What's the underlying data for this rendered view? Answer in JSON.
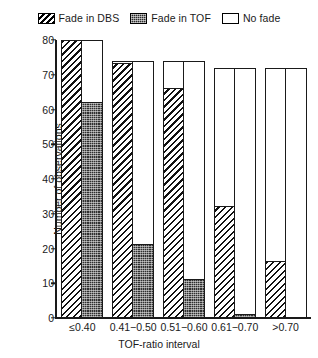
{
  "chart_data": {
    "type": "bar",
    "title": "",
    "subtitle": "",
    "xlabel": "TOF-ratio interval",
    "ylabel": "Number of observations",
    "categories": [
      "≤0.40",
      "0.41−0.50",
      "0.51−0.60",
      "0.61−0.70",
      ">0.70"
    ],
    "ylim": [
      0,
      80
    ],
    "yticks": [
      0,
      10,
      20,
      30,
      40,
      50,
      60,
      70,
      80
    ],
    "grid": false,
    "legend_position": "top-center",
    "layout": "paired-columns: left column = Fade in DBS count; right column = Fade in TOF (bottom, stacked) + No fade (top)",
    "series": [
      {
        "name": "Fade in DBS",
        "pattern": "diagonal-hatch",
        "column": "left",
        "values": [
          80,
          73,
          66,
          32,
          16
        ]
      },
      {
        "name": "Fade in TOF",
        "pattern": "dark-stipple",
        "column": "right-bottom",
        "values": [
          62,
          21,
          11,
          1,
          0
        ]
      },
      {
        "name": "No fade",
        "pattern": "white",
        "column": "right-top",
        "values": [
          18,
          53,
          63,
          71,
          72
        ]
      }
    ],
    "group_totals": [
      80,
      74,
      74,
      72,
      72
    ],
    "annotations": []
  },
  "legend": {
    "items": [
      {
        "label": "Fade in DBS",
        "swatch": "diagonal-hatch-swatch"
      },
      {
        "label": "Fade in TOF",
        "swatch": "dark-stipple-swatch"
      },
      {
        "label": "No fade",
        "swatch": "white-swatch"
      }
    ]
  },
  "axes": {
    "y": {
      "title": "Number of observations",
      "ticks": [
        "0",
        "10",
        "20",
        "30",
        "40",
        "50",
        "60",
        "70",
        "80"
      ]
    },
    "x": {
      "title": "TOF-ratio interval",
      "ticks": [
        "≤0.40",
        "0.41−0.50",
        "0.51−0.60",
        "0.61−0.70",
        ">0.70"
      ]
    }
  },
  "colors": {
    "ink": "#1a1a1a",
    "background": "#ffffff",
    "tof_fill": "#303030"
  }
}
